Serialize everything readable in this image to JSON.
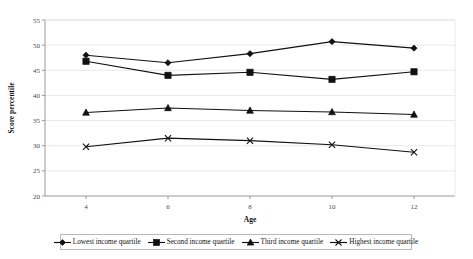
{
  "chart_data": {
    "type": "line",
    "title": "",
    "xlabel": "Age",
    "ylabel": "Score percentile",
    "x": [
      4,
      6,
      8,
      10,
      12
    ],
    "xtick_labels": [
      "4",
      "6",
      "8",
      "10",
      "12"
    ],
    "ytick_labels": [
      "20",
      "25",
      "30",
      "35",
      "40",
      "45",
      "50",
      "55"
    ],
    "ylim": [
      20,
      55
    ],
    "xlim": [
      3,
      13
    ],
    "ystep": 5,
    "grid": true,
    "legend_position": "bottom",
    "series": [
      {
        "name": "Lowest income quartile",
        "marker": "diamond",
        "values": [
          48.0,
          46.5,
          48.3,
          50.7,
          49.4
        ]
      },
      {
        "name": "Second income quartile",
        "marker": "square",
        "values": [
          46.8,
          44.0,
          44.6,
          43.2,
          44.7
        ]
      },
      {
        "name": "Third income quartile",
        "marker": "triangle",
        "values": [
          36.6,
          37.5,
          37.0,
          36.7,
          36.2
        ]
      },
      {
        "name": "Highest income quartile",
        "marker": "x",
        "values": [
          29.8,
          31.5,
          31.0,
          30.2,
          28.7
        ]
      }
    ],
    "colors": {
      "series": "#111111",
      "axis": "#9a9a9a",
      "grid": "#e2e2e2",
      "background": "#ffffff"
    }
  }
}
